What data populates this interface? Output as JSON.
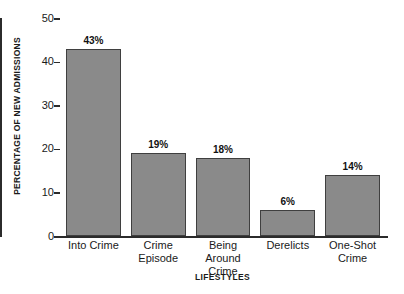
{
  "chart_data": {
    "type": "bar",
    "title": "",
    "xlabel": "LIFESTYLES",
    "ylabel": "PERCENTAGE OF NEW ADMISSIONS",
    "categories": [
      "Into Crime",
      "Crime Episode",
      "Being Around Crime",
      "Derelicts",
      "One-Shot Crime"
    ],
    "category_lines": [
      [
        "Into Crime"
      ],
      [
        "Crime",
        "Episode"
      ],
      [
        "Being Around",
        "Crime"
      ],
      [
        "Derelicts"
      ],
      [
        "One-Shot",
        "Crime"
      ]
    ],
    "values": [
      43,
      19,
      18,
      6,
      14
    ],
    "value_labels": [
      "43%",
      "19%",
      "18%",
      "6%",
      "14%"
    ],
    "ylim": [
      0,
      50
    ],
    "yticks": [
      0,
      10,
      20,
      30,
      40,
      50
    ],
    "ytick_labels": [
      "0",
      "10",
      "20",
      "30",
      "40",
      "50"
    ],
    "grid": false,
    "legend": null,
    "bar_color": "#8a8a8a",
    "bar_border_color": "#3f3f3f",
    "axis_color": "#2b2b2b",
    "background_color": "#ffffff"
  }
}
